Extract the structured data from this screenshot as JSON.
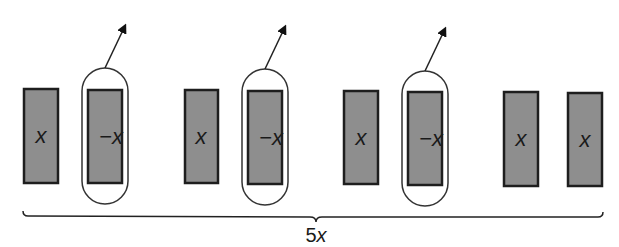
{
  "diagram": {
    "type": "algebra-tiles",
    "colors": {
      "tile_fill": "#8e8e8e",
      "tile_stroke": "#1e1e1e",
      "outline": "#333333",
      "text": "#1a1a1a",
      "background": "#ffffff"
    },
    "tiles": [
      {
        "label": "x",
        "grouped": false,
        "x": 24,
        "y": 89
      },
      {
        "label": "−x",
        "grouped": true,
        "x": 88,
        "y": 90
      },
      {
        "label": "x",
        "grouped": false,
        "x": 185,
        "y": 90
      },
      {
        "label": "−x",
        "grouped": true,
        "x": 248,
        "y": 91
      },
      {
        "label": "x",
        "grouped": false,
        "x": 344,
        "y": 91
      },
      {
        "label": "−x",
        "grouped": true,
        "x": 408,
        "y": 92
      },
      {
        "label": "x",
        "grouped": false,
        "x": 504,
        "y": 92
      },
      {
        "label": "x",
        "grouped": false,
        "x": 568,
        "y": 93
      }
    ],
    "brace": {
      "label": "5x"
    }
  }
}
